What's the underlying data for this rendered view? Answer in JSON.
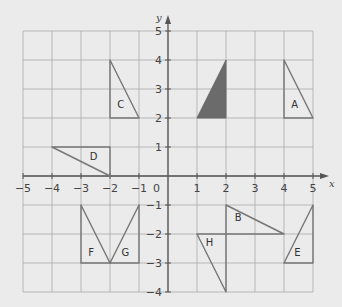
{
  "diagram": {
    "type": "coordinate-grid-transformations",
    "x_axis": {
      "label": "x",
      "min": -5,
      "max": 5,
      "ticks": [
        "-5",
        "-4",
        "-3",
        "-2",
        "-1",
        "1",
        "2",
        "3",
        "4",
        "5"
      ]
    },
    "y_axis": {
      "label": "y",
      "min": -4,
      "max": 5,
      "ticks": [
        "5",
        "4",
        "3",
        "2",
        "1",
        "-1",
        "-2",
        "-3",
        "-4"
      ]
    },
    "origin_label": "0",
    "colors": {
      "background": "#ebebeb",
      "grid": "#aaaaaa",
      "axis": "#555555",
      "shape_stroke": "#777777",
      "object_fill": "#6b6b6b"
    },
    "object_shape": {
      "name": "object",
      "filled": true,
      "vertices": [
        [
          1,
          2
        ],
        [
          2,
          2
        ],
        [
          2,
          4
        ]
      ]
    },
    "shapes": [
      {
        "label": "A",
        "vertices": [
          [
            4,
            2
          ],
          [
            5,
            2
          ],
          [
            4,
            4
          ]
        ],
        "label_pos": [
          4.25,
          2.35
        ]
      },
      {
        "label": "B",
        "vertices": [
          [
            2,
            -1
          ],
          [
            2,
            -2
          ],
          [
            4,
            -2
          ]
        ],
        "label_pos": [
          2.3,
          -1.55
        ]
      },
      {
        "label": "C",
        "vertices": [
          [
            -2,
            2
          ],
          [
            -1,
            2
          ],
          [
            -2,
            4
          ]
        ],
        "label_pos": [
          -1.75,
          2.35
        ]
      },
      {
        "label": "D",
        "vertices": [
          [
            -2,
            0
          ],
          [
            -2,
            1
          ],
          [
            -4,
            1
          ]
        ],
        "label_pos": [
          -2.7,
          0.55
        ]
      },
      {
        "label": "E",
        "vertices": [
          [
            4,
            -3
          ],
          [
            5,
            -3
          ],
          [
            5,
            -1
          ]
        ],
        "label_pos": [
          4.35,
          -2.75
        ]
      },
      {
        "label": "F",
        "vertices": [
          [
            -3,
            -3
          ],
          [
            -2,
            -3
          ],
          [
            -3,
            -1
          ]
        ],
        "label_pos": [
          -2.75,
          -2.75
        ]
      },
      {
        "label": "G",
        "vertices": [
          [
            -1,
            -3
          ],
          [
            -2,
            -3
          ],
          [
            -1,
            -1
          ]
        ],
        "label_pos": [
          -1.6,
          -2.75
        ]
      },
      {
        "label": "H",
        "vertices": [
          [
            1,
            -2
          ],
          [
            2,
            -2
          ],
          [
            2,
            -4
          ]
        ],
        "label_pos": [
          1.3,
          -2.4
        ]
      }
    ]
  }
}
